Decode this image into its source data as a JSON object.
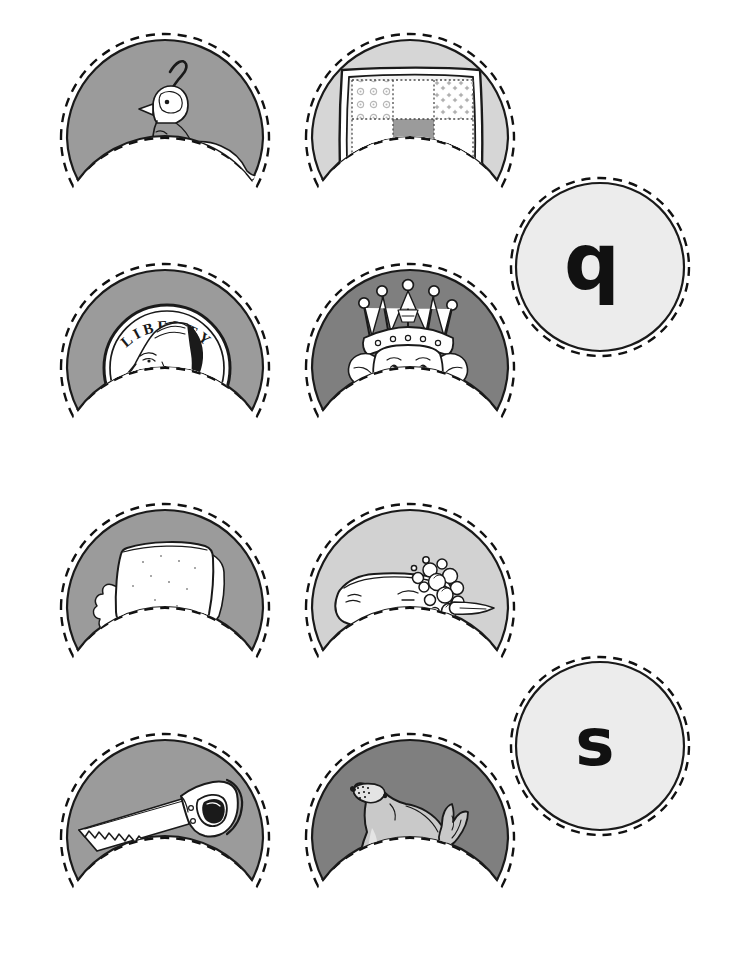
{
  "page": {
    "width": 729,
    "height": 974,
    "background": "#ffffff"
  },
  "style": {
    "ink": "#1a1a1a",
    "cut_line": "#111111",
    "fill_light": "#ececec",
    "fill_quilt": "#d6d6d6",
    "fill_soap": "#d2d2d2",
    "fill_medium": "#9b9b9b",
    "fill_dark": "#7f7f7f",
    "art_white": "#ffffff",
    "art_tint": "#c9c9c9"
  },
  "groups": [
    {
      "id": "group-q",
      "letter": "q",
      "letter_card": {
        "name": "letter-card-q",
        "letter": "q",
        "shape": "circle",
        "fill": "#ececec",
        "cx": 600,
        "cy": 267,
        "r": 84
      },
      "picture_cards": [
        {
          "id": "quail",
          "label": "quail",
          "icon": "quail-icon",
          "fill": "#9b9b9b",
          "cx": 165,
          "cy": 128,
          "r": 98
        },
        {
          "id": "quilt",
          "label": "quilt",
          "icon": "quilt-icon",
          "fill": "#d6d6d6",
          "cx": 410,
          "cy": 128,
          "r": 98
        },
        {
          "id": "quarter",
          "label": "quarter",
          "icon": "quarter-coin-icon",
          "fill": "#9b9b9b",
          "cx": 165,
          "cy": 358,
          "r": 98
        },
        {
          "id": "queen",
          "label": "queen",
          "icon": "queen-icon",
          "fill": "#7f7f7f",
          "cx": 410,
          "cy": 358,
          "r": 98
        }
      ]
    },
    {
      "id": "group-s",
      "letter": "s",
      "letter_card": {
        "name": "letter-card-s",
        "letter": "s",
        "shape": "circle",
        "fill": "#ececec",
        "cx": 600,
        "cy": 746,
        "r": 84
      },
      "picture_cards": [
        {
          "id": "sandwich",
          "label": "sandwich",
          "icon": "sandwich-icon",
          "fill": "#9b9b9b",
          "cx": 165,
          "cy": 598,
          "r": 98
        },
        {
          "id": "soap",
          "label": "soap",
          "icon": "soap-icon",
          "fill": "#d2d2d2",
          "cx": 410,
          "cy": 598,
          "r": 98
        },
        {
          "id": "saw",
          "label": "saw",
          "icon": "saw-icon",
          "fill": "#9b9b9b",
          "cx": 165,
          "cy": 828,
          "r": 98
        },
        {
          "id": "seal",
          "label": "seal",
          "icon": "seal-icon",
          "fill": "#7f7f7f",
          "cx": 410,
          "cy": 828,
          "r": 98
        }
      ]
    }
  ],
  "quarter": {
    "legend_text": "LIBERTY",
    "date_text": "1932"
  },
  "quilt": {
    "rows": 3,
    "cols": 3,
    "patches": [
      [
        "swirl",
        "plain",
        "star"
      ],
      [
        "plain",
        "solid",
        "plain"
      ],
      [
        "dot",
        "plain",
        "dot"
      ]
    ]
  }
}
